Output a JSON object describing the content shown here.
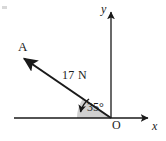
{
  "figure": {
    "type": "vector-force-diagram",
    "background_color": "#ffffff",
    "stroke_color": "#1a1a1a",
    "sector_fill_color": "#d0d0d0",
    "labels": {
      "point_a": "A",
      "force_magnitude": "17 N",
      "angle": "35°",
      "origin": "O",
      "y_axis": "y",
      "x_axis": "x"
    },
    "geometry": {
      "origin_point": [
        111,
        118
      ],
      "vector_tip": [
        22,
        57
      ],
      "x_axis_start": [
        14,
        118
      ],
      "x_axis_end": [
        150,
        118
      ],
      "y_axis_top": [
        111,
        10
      ],
      "y_axis_bottom": [
        111,
        118
      ],
      "angle_degrees": 35,
      "sector_radius": 34
    }
  }
}
